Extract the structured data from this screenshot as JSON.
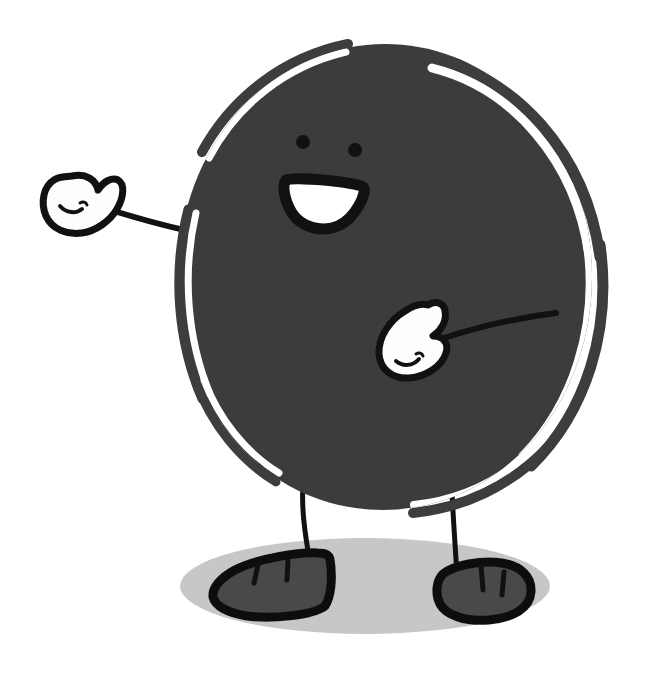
{
  "canvas": {
    "width": 645,
    "height": 689,
    "background_color": "#ffffff",
    "title": "Smiling round character waving",
    "alt_text": "A hand-drawn cartoon of a large dark gray round body with two dot eyes, an open smiling mouth, two white mitten hands on thin arms, two thin legs and dark gray shoes, standing on a light gray oval shadow."
  },
  "palette": {
    "body_fill": "#3d3d3d",
    "outline": "#111111",
    "hand_fill": "#fdfdfd",
    "mouth_fill": "#ffffff",
    "shoe_fill": "#4a4a4a",
    "ground_shadow": "#c9c9c9",
    "background": "#ffffff"
  },
  "character": {
    "name": "round-character",
    "body": {
      "label": "Body",
      "shape": "circle",
      "center_x": 385,
      "center_y": 277,
      "radius_x": 207,
      "radius_y": 233,
      "fill": "#3d3d3d"
    },
    "face": {
      "label": "Face",
      "eyes": [
        {
          "label": "Left eye",
          "cx": 303,
          "cy": 142,
          "r": 7
        },
        {
          "label": "Right eye",
          "cx": 355,
          "cy": 150,
          "r": 7
        }
      ],
      "mouth": {
        "label": "Open smile",
        "cx": 325,
        "cy": 188,
        "width": 78,
        "height": 54,
        "fill": "#ffffff",
        "stroke": "#111111"
      }
    },
    "arms": [
      {
        "label": "Left arm",
        "side": "left",
        "from_x": 196,
        "from_y": 232,
        "to_x": 100,
        "to_y": 206
      },
      {
        "label": "Right arm",
        "side": "right",
        "from_x": 553,
        "from_y": 315,
        "to_x": 442,
        "to_y": 338
      }
    ],
    "hands": [
      {
        "label": "Left hand",
        "side": "left",
        "cx": 72,
        "cy": 204,
        "fill": "#fdfdfd",
        "stroke": "#111111"
      },
      {
        "label": "Right hand",
        "side": "right",
        "cx": 423,
        "cy": 343,
        "fill": "#fdfdfd",
        "stroke": "#111111"
      }
    ],
    "legs": [
      {
        "label": "Left leg",
        "side": "left",
        "from_x": 303,
        "from_y": 489,
        "to_x": 313,
        "to_y": 565
      },
      {
        "label": "Right leg",
        "side": "right",
        "from_x": 452,
        "from_y": 487,
        "to_x": 457,
        "to_y": 573
      }
    ],
    "shoes": [
      {
        "label": "Left shoe",
        "side": "left",
        "cx": 283,
        "cy": 585,
        "fill": "#4a4a4a",
        "lace_count": 2
      },
      {
        "label": "Right shoe",
        "side": "right",
        "cx": 482,
        "cy": 594,
        "fill": "#4a4a4a",
        "lace_count": 2
      }
    ],
    "highlights": {
      "label": "Sketch rim highlights",
      "count": 6,
      "description": "White gaps between the body fill and the outer hand-drawn stroke arcs"
    }
  },
  "ground": {
    "label": "Ground shadow",
    "cx": 365,
    "cy": 586,
    "rx": 185,
    "ry": 48,
    "fill": "#c9c9c9"
  }
}
